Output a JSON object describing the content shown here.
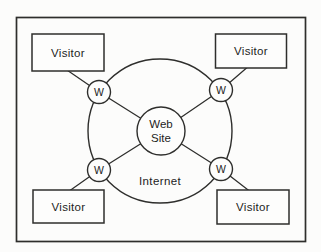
{
  "diagram": {
    "type": "network-topology",
    "colors": {
      "stroke": "#2e2e2c",
      "text": "#1d1d1d",
      "background": "#fcfcfb",
      "shape_fill": "#fdfdfc"
    },
    "internet": {
      "label": "Internet"
    },
    "web_site": {
      "line1": "Web",
      "line2": "Site"
    },
    "visitors": [
      {
        "position": "top-left",
        "label": "Visitor"
      },
      {
        "position": "top-right",
        "label": "Visitor"
      },
      {
        "position": "bottom-left",
        "label": "Visitor"
      },
      {
        "position": "bottom-right",
        "label": "Visitor"
      }
    ],
    "w_nodes": [
      {
        "position": "top-left",
        "label": "W"
      },
      {
        "position": "top-right",
        "label": "W"
      },
      {
        "position": "bottom-left",
        "label": "W"
      },
      {
        "position": "bottom-right",
        "label": "W"
      }
    ]
  }
}
